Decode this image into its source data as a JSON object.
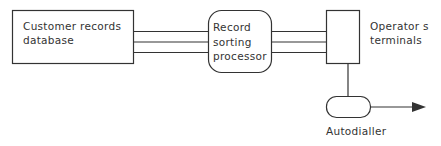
{
  "diagram": {
    "nodes": [
      {
        "id": "database",
        "label_lines": [
          "Customer records",
          "database"
        ],
        "shape": "rectangle"
      },
      {
        "id": "processor",
        "label_lines": [
          "Record",
          "sorting",
          "processor"
        ],
        "shape": "rounded-rectangle"
      },
      {
        "id": "terminals",
        "label_lines": [
          "Operator s",
          "terminals"
        ],
        "shape": "rectangle"
      },
      {
        "id": "autodialler",
        "label_lines": [
          "Autodialler"
        ],
        "shape": "pill"
      }
    ],
    "edges": [
      {
        "from": "database",
        "to": "processor",
        "style": "triple-line"
      },
      {
        "from": "processor",
        "to": "terminals",
        "style": "triple-line"
      },
      {
        "from": "terminals",
        "to": "autodialler",
        "style": "line"
      },
      {
        "from": "autodialler",
        "to": "external",
        "style": "arrow"
      }
    ],
    "colors": {
      "stroke": "#333333",
      "background": "#ffffff"
    }
  }
}
